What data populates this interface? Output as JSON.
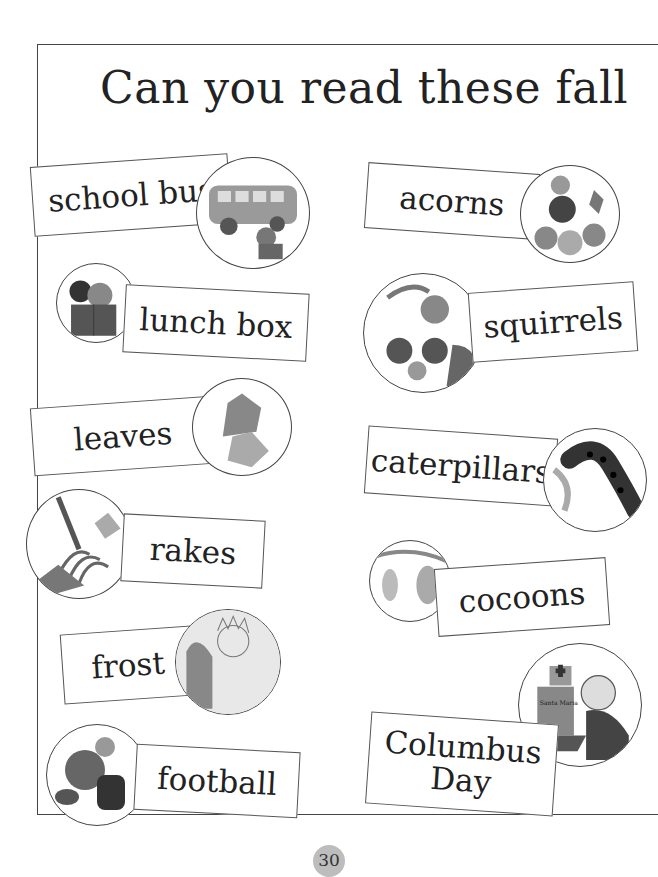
{
  "page": {
    "title": "Can you read these fall",
    "page_number": "30"
  },
  "left_column": [
    {
      "word": "school bus",
      "picture": "school-bus-illustration"
    },
    {
      "word": "lunch box",
      "picture": "lunch-box-illustration"
    },
    {
      "word": "leaves",
      "picture": "leaves-illustration"
    },
    {
      "word": "rakes",
      "picture": "rake-illustration"
    },
    {
      "word": "frost",
      "picture": "frost-illustration"
    },
    {
      "word": "football",
      "picture": "football-illustration"
    }
  ],
  "right_column": [
    {
      "word": "acorns",
      "picture": "acorns-illustration"
    },
    {
      "word": "squirrels",
      "picture": "squirrels-illustration"
    },
    {
      "word": "caterpillars",
      "picture": "caterpillar-illustration"
    },
    {
      "word": "cocoons",
      "picture": "cocoons-illustration"
    },
    {
      "word": "Columbus",
      "word_line2": "Day",
      "picture": "columbus-ship-illustration",
      "ship_label": "Santa Maria"
    }
  ],
  "colors": {
    "frame": "#444444",
    "card_border": "#555555",
    "page_number_badge": "#bdbdbd"
  }
}
